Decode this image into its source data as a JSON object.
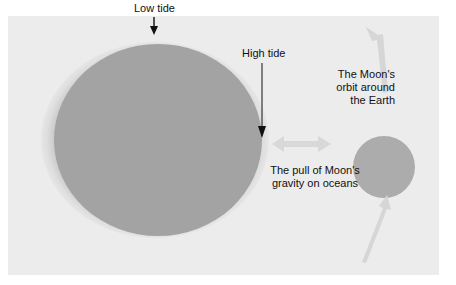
{
  "diagram": {
    "labels": {
      "low_tide": "Low tide",
      "high_tide": "High tide",
      "moon_orbit": [
        "The Moon's",
        "orbit around",
        "the Earth"
      ],
      "gravity_pull": [
        "The pull of Moon's",
        "gravity on oceans"
      ]
    },
    "objects": [
      {
        "name": "Earth",
        "shape": "circle"
      },
      {
        "name": "Ocean bulge",
        "shape": "ellipse"
      },
      {
        "name": "Moon",
        "shape": "circle"
      }
    ],
    "arrows": [
      {
        "name": "low-tide-pointer",
        "direction": "down"
      },
      {
        "name": "high-tide-pointer",
        "direction": "down"
      },
      {
        "name": "gravity-pull",
        "direction": "bidirectional-horizontal"
      },
      {
        "name": "orbit-upper",
        "direction": "up"
      },
      {
        "name": "orbit-lower",
        "direction": "up"
      }
    ],
    "colors": {
      "panel": "#ececec",
      "earth": "#a3a3a3",
      "ocean": "#dcdcdc",
      "moon": "#acacac",
      "arrow_light": "#d6d6d6",
      "pointer": "#111111"
    }
  }
}
